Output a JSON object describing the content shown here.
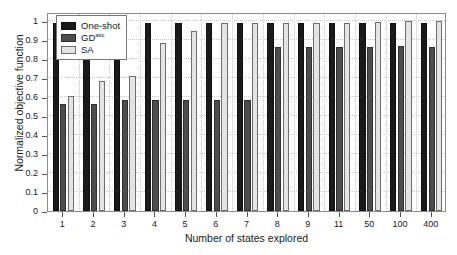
{
  "chart_data": {
    "type": "bar",
    "title": "",
    "xlabel": "Number of states explored",
    "ylabel": "Normalized objective function",
    "categories": [
      "1",
      "2",
      "3",
      "4",
      "5",
      "6",
      "7",
      "8",
      "9",
      "11",
      "50",
      "100",
      "400"
    ],
    "series": [
      {
        "name": "One-shot",
        "color": "#1a1a1a",
        "values": [
          0.99,
          0.99,
          0.99,
          0.99,
          0.99,
          0.99,
          0.99,
          0.99,
          0.99,
          0.99,
          0.99,
          0.99,
          0.99
        ]
      },
      {
        "name": "GD",
        "name_superscript": "asc",
        "color": "#4d4d4d",
        "values": [
          0.565,
          0.565,
          0.588,
          0.588,
          0.588,
          0.588,
          0.588,
          0.868,
          0.868,
          0.868,
          0.868,
          0.87,
          0.868
        ]
      },
      {
        "name": "SA",
        "color": "#e4e4e4",
        "values": [
          0.605,
          0.685,
          0.71,
          0.885,
          0.95,
          0.99,
          0.99,
          0.99,
          0.99,
          0.99,
          0.995,
          1.0,
          1.0
        ]
      }
    ],
    "ylim": [
      0,
      1.05
    ],
    "yticks": [
      "0",
      "0.1",
      "0.2",
      "0.3",
      "0.4",
      "0.5",
      "0.6",
      "0.7",
      "0.8",
      "0.9",
      "1"
    ],
    "ytick_values": [
      0,
      0.1,
      0.2,
      0.3,
      0.4,
      0.5,
      0.6,
      0.7,
      0.8,
      0.9,
      1.0
    ],
    "grid": true,
    "legend_position": "upper-left"
  },
  "legend": {
    "entries": [
      {
        "label": "One-shot",
        "superscript": ""
      },
      {
        "label": "GD",
        "superscript": "asc"
      },
      {
        "label": "SA",
        "superscript": ""
      }
    ]
  }
}
